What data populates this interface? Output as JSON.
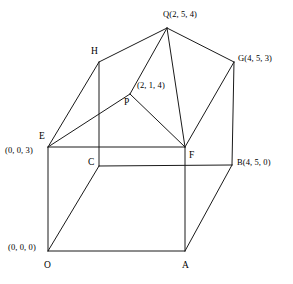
{
  "figure": {
    "width": 293,
    "height": 284,
    "background_color": "#ffffff",
    "line_color": "#1a1a1a"
  },
  "vertices": [
    {
      "id": "O",
      "label": "O",
      "coord_text": "(0, 0, 0)",
      "x": 48,
      "y": 251
    },
    {
      "id": "A",
      "label": "A",
      "coord_text": "",
      "x": 185,
      "y": 251
    },
    {
      "id": "B",
      "label": "B",
      "coord_text": "(4, 5, 0)",
      "x": 232,
      "y": 165
    },
    {
      "id": "C",
      "label": "C",
      "coord_text": "",
      "x": 99,
      "y": 166
    },
    {
      "id": "E",
      "label": "E",
      "coord_text": "(0, 0, 3)",
      "x": 48,
      "y": 147
    },
    {
      "id": "F",
      "label": "F",
      "coord_text": "",
      "x": 185,
      "y": 147
    },
    {
      "id": "G",
      "label": "G",
      "coord_text": "(4, 5, 3)",
      "x": 234,
      "y": 62
    },
    {
      "id": "H",
      "label": "H",
      "coord_text": "",
      "x": 99,
      "y": 62
    },
    {
      "id": "P",
      "label": "P",
      "coord_text": "(2, 1, 4)",
      "x": 130,
      "y": 94
    },
    {
      "id": "Q",
      "label": "Q",
      "coord_text": "(2, 5, 4)",
      "x": 167,
      "y": 28
    }
  ],
  "labels": [
    {
      "name": "label-Q",
      "text": "Q(2, 5, 4)",
      "x": 163,
      "y": 10,
      "anchor": "start"
    },
    {
      "name": "label-H",
      "text": "H",
      "x": 91,
      "y": 47,
      "anchor": "start"
    },
    {
      "name": "label-G",
      "text": "G(4, 5, 3)",
      "x": 238,
      "y": 54,
      "anchor": "start"
    },
    {
      "name": "label-P-coord",
      "text": "(2, 1, 4)",
      "x": 137,
      "y": 81,
      "anchor": "start"
    },
    {
      "name": "label-P",
      "text": "P",
      "x": 124,
      "y": 98,
      "anchor": "start"
    },
    {
      "name": "label-E",
      "text": "E",
      "x": 39,
      "y": 132,
      "anchor": "start"
    },
    {
      "name": "label-E-coord",
      "text": "(0, 0, 3)",
      "x": 5,
      "y": 146,
      "anchor": "start"
    },
    {
      "name": "label-C",
      "text": "C",
      "x": 88,
      "y": 158,
      "anchor": "start"
    },
    {
      "name": "label-F",
      "text": "F",
      "x": 189,
      "y": 151,
      "anchor": "start"
    },
    {
      "name": "label-B",
      "text": "B(4, 5, 0)",
      "x": 237,
      "y": 158,
      "anchor": "start"
    },
    {
      "name": "label-O-coord",
      "text": "(0, 0, 0)",
      "x": 8,
      "y": 243,
      "anchor": "start"
    },
    {
      "name": "label-O",
      "text": "O",
      "x": 44,
      "y": 261,
      "anchor": "start"
    },
    {
      "name": "label-A",
      "text": "A",
      "x": 182,
      "y": 261,
      "anchor": "start"
    }
  ],
  "edges": [
    {
      "name": "edge-O-A",
      "from": "O",
      "to": "A",
      "x1": 48,
      "y1": 251,
      "x2": 185,
      "y2": 251
    },
    {
      "name": "edge-O-E",
      "from": "O",
      "to": "E",
      "x1": 48,
      "y1": 251,
      "x2": 48,
      "y2": 147
    },
    {
      "name": "edge-O-C",
      "from": "O",
      "to": "C",
      "x1": 48,
      "y1": 251,
      "x2": 99,
      "y2": 166
    },
    {
      "name": "edge-A-F",
      "from": "A",
      "to": "F",
      "x1": 185,
      "y1": 251,
      "x2": 185,
      "y2": 147
    },
    {
      "name": "edge-A-B",
      "from": "A",
      "to": "B",
      "x1": 185,
      "y1": 251,
      "x2": 232,
      "y2": 165
    },
    {
      "name": "edge-C-B",
      "from": "C",
      "to": "B",
      "x1": 99,
      "y1": 166,
      "x2": 232,
      "y2": 165
    },
    {
      "name": "edge-C-H",
      "from": "C",
      "to": "H",
      "x1": 99,
      "y1": 166,
      "x2": 99,
      "y2": 62
    },
    {
      "name": "edge-E-F",
      "from": "E",
      "to": "F",
      "x1": 48,
      "y1": 147,
      "x2": 185,
      "y2": 147
    },
    {
      "name": "edge-E-H",
      "from": "E",
      "to": "H",
      "x1": 48,
      "y1": 147,
      "x2": 99,
      "y2": 62
    },
    {
      "name": "edge-E-P",
      "from": "E",
      "to": "P",
      "x1": 48,
      "y1": 147,
      "x2": 130,
      "y2": 94
    },
    {
      "name": "edge-B-G",
      "from": "B",
      "to": "G",
      "x1": 232,
      "y1": 165,
      "x2": 234,
      "y2": 62
    },
    {
      "name": "edge-F-G",
      "from": "F",
      "to": "G",
      "x1": 185,
      "y1": 147,
      "x2": 234,
      "y2": 62
    },
    {
      "name": "edge-F-P",
      "from": "F",
      "to": "P",
      "x1": 185,
      "y1": 147,
      "x2": 130,
      "y2": 94
    },
    {
      "name": "edge-F-Q",
      "from": "F",
      "to": "Q",
      "x1": 185,
      "y1": 147,
      "x2": 167,
      "y2": 28
    },
    {
      "name": "edge-H-Q",
      "from": "H",
      "to": "Q",
      "x1": 99,
      "y1": 62,
      "x2": 167,
      "y2": 28
    },
    {
      "name": "edge-G-Q",
      "from": "G",
      "to": "Q",
      "x1": 234,
      "y1": 62,
      "x2": 167,
      "y2": 28
    },
    {
      "name": "edge-P-Q",
      "from": "P",
      "to": "Q",
      "x1": 130,
      "y1": 94,
      "x2": 167,
      "y2": 28
    }
  ]
}
